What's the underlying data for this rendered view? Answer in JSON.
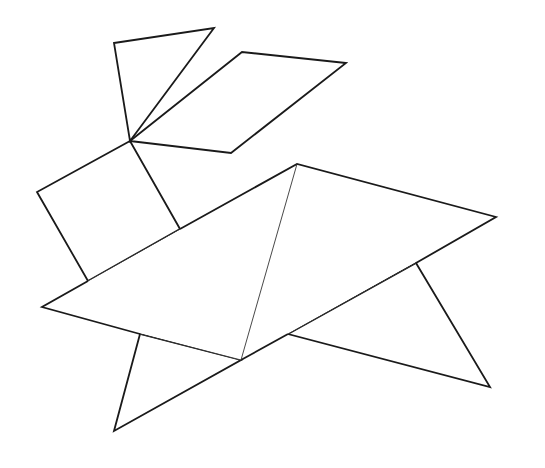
{
  "figure": {
    "title": "",
    "stroke_color": "#1a1a1a",
    "background": "#ffffff",
    "pieces": [
      {
        "name": "ear-triangle",
        "points": "114,43 214,28 130,141"
      },
      {
        "name": "ear-parallelogram",
        "points": "130,141 242,52 346,63 231,153"
      },
      {
        "name": "head-square",
        "points": "130,141 37,192 88,281 180,229"
      },
      {
        "name": "body-large-triangle-left",
        "points": "42,307 297,164 241,360"
      },
      {
        "name": "body-large-triangle-right",
        "points": "297,164 496,217 241,360"
      },
      {
        "name": "front-leg-triangle",
        "points": "140,334 114,431 241,360"
      },
      {
        "name": "back-leg-triangle",
        "points": "416,263 490,387 288,334"
      }
    ]
  }
}
